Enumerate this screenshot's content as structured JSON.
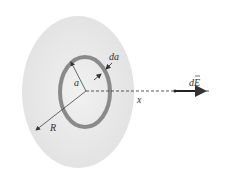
{
  "diagram": {
    "title": "",
    "labels": {
      "ring_radius": "a",
      "ring_width": "da",
      "disk_radius": "R",
      "axis": "x",
      "field": "dE"
    },
    "colors": {
      "disk": "#e9e9e9",
      "ring": "#8a8a8a",
      "lines": "#333333",
      "background": "#ffffff"
    }
  }
}
